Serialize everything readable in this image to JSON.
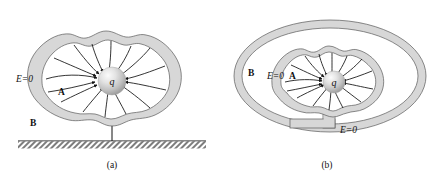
{
  "figure": {
    "background_color": "#ffffff",
    "shell_fill_color": "#d7d7d7",
    "shell_stroke_color": "#5a5a5a",
    "line_color": "#111111",
    "panels": [
      {
        "id": "a",
        "caption": "(a)",
        "labels": {
          "field_zero": "E=0",
          "cavity_region": "A",
          "outside_region": "B",
          "charge": "q"
        },
        "description_elements": {
          "conductor_shape": "irregular-blob-shell",
          "ground_symbol": "hatched-ground",
          "field_line_count": 14,
          "field_line_direction": "inward-toward-charge"
        }
      },
      {
        "id": "b",
        "caption": "(b)",
        "labels": {
          "field_zero_inner": "E=0",
          "field_zero_outer": "E=0",
          "cavity_region": "A",
          "outside_region": "B",
          "charge": "q"
        },
        "description_elements": {
          "outer_shape": "oval-ring-shell",
          "inner_shape": "irregular-blob-shell",
          "connector": "vertical-band",
          "field_line_count": 14,
          "field_line_direction": "inward-toward-charge"
        }
      }
    ]
  }
}
